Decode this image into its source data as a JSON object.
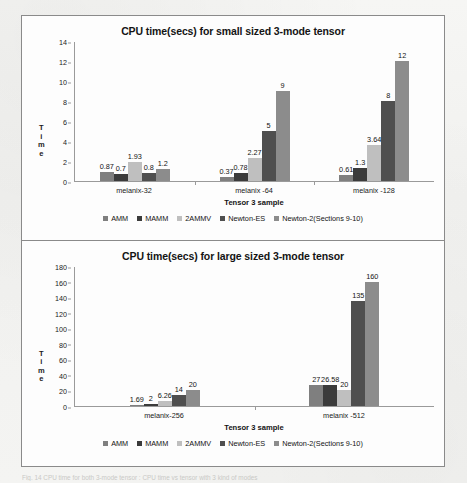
{
  "figure": {
    "caption": "Fig. 14 CPU time for both 3-mode tensor : CPU time vs tensor with 3 kind of modes"
  },
  "legend": {
    "items": [
      {
        "label": "AMM",
        "color": "#7f7f7f"
      },
      {
        "label": "MAMM",
        "color": "#3b3b3b"
      },
      {
        "label": "2AMMV",
        "color": "#bfbfbf"
      },
      {
        "label": "Newton-ES",
        "color": "#4f4f4f"
      },
      {
        "label": "Newton-2(Sections 9-10)",
        "color": "#8c8c8c"
      }
    ]
  },
  "chart_data": [
    {
      "type": "bar",
      "id": "small",
      "title": "CPU time(secs) for small sized 3-mode tensor",
      "xlabel": "Tensor 3 sample",
      "ylabel": "Time",
      "ylabel_chars": [
        "T",
        "i",
        "m",
        "e"
      ],
      "ylim": [
        0,
        14
      ],
      "yticks": [
        0,
        2,
        4,
        6,
        8,
        10,
        12,
        14
      ],
      "grid": false,
      "legend_position": "bottom",
      "categories": [
        "melanix-32",
        "melanix -64",
        "melanix -128"
      ],
      "series": [
        {
          "name": "AMM",
          "color": "#7f7f7f",
          "values": [
            0.87,
            0.37,
            0.61
          ],
          "labels": [
            "0.87",
            "0.37",
            "0.61"
          ]
        },
        {
          "name": "MAMM",
          "color": "#3b3b3b",
          "values": [
            0.7,
            0.78,
            1.3
          ],
          "labels": [
            "0.7",
            "0.78",
            "1.3"
          ]
        },
        {
          "name": "2AMMV",
          "color": "#bfbfbf",
          "values": [
            1.93,
            2.27,
            3.64
          ],
          "labels": [
            "1.93",
            "2.27",
            "3.64"
          ]
        },
        {
          "name": "Newton-ES",
          "color": "#4f4f4f",
          "values": [
            0.8,
            5,
            8
          ],
          "labels": [
            "0.8",
            "5",
            "8"
          ]
        },
        {
          "name": "Newton-2(Sections 9-10)",
          "color": "#8c8c8c",
          "values": [
            1.2,
            9,
            12
          ],
          "labels": [
            "1.2",
            "9",
            "12"
          ]
        }
      ]
    },
    {
      "type": "bar",
      "id": "large",
      "title": "CPU time(secs) for large sized 3-mode tensor",
      "xlabel": "Tensor 3 sample",
      "ylabel": "Time",
      "ylabel_chars": [
        "T",
        "i",
        "m",
        "e"
      ],
      "ylim": [
        0,
        180
      ],
      "yticks": [
        0,
        20,
        40,
        60,
        80,
        100,
        120,
        140,
        160,
        180
      ],
      "grid": false,
      "legend_position": "bottom",
      "categories": [
        "melanix-256",
        "melanix -512"
      ],
      "series": [
        {
          "name": "AMM",
          "color": "#7f7f7f",
          "values": [
            1.69,
            27
          ],
          "labels": [
            "1.69",
            "27"
          ]
        },
        {
          "name": "MAMM",
          "color": "#3b3b3b",
          "values": [
            2,
            26.58
          ],
          "labels": [
            "2",
            "26.58"
          ]
        },
        {
          "name": "2AMMV",
          "color": "#bfbfbf",
          "values": [
            6.26,
            20
          ],
          "labels": [
            "6.26",
            "20"
          ]
        },
        {
          "name": "Newton-ES",
          "color": "#4f4f4f",
          "values": [
            14,
            135
          ],
          "labels": [
            "14",
            "135"
          ]
        },
        {
          "name": "Newton-2(Sections 9-10)",
          "color": "#8c8c8c",
          "values": [
            20,
            160
          ],
          "labels": [
            "20",
            "160"
          ]
        }
      ]
    }
  ]
}
